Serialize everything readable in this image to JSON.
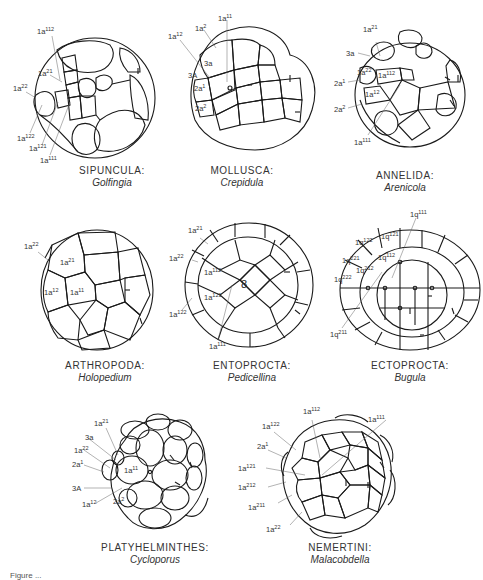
{
  "panels": [
    {
      "id": "sipuncula",
      "phylum": "Sipuncula:",
      "genus": "Golfingia",
      "labels": [
        {
          "base": "1a",
          "sup": "112"
        },
        {
          "base": "1a",
          "sup": "21"
        },
        {
          "base": "1a",
          "sup": "22"
        },
        {
          "base": "1a",
          "sup": "122"
        },
        {
          "base": "1a",
          "sup": "121"
        },
        {
          "base": "1a",
          "sup": "111"
        }
      ]
    },
    {
      "id": "mollusca",
      "phylum": "Mollusca:",
      "genus": "Crepidula",
      "labels": [
        {
          "base": "1a",
          "sup": "11"
        },
        {
          "base": "1a",
          "sup": "2"
        },
        {
          "base": "1a",
          "sup": "12"
        },
        {
          "base": "3a",
          "sup": ""
        },
        {
          "base": "3A",
          "sup": ""
        },
        {
          "base": "2a",
          "sup": "1"
        },
        {
          "base": "2a",
          "sup": "2"
        }
      ]
    },
    {
      "id": "annelida",
      "phylum": "Annelida:",
      "genus": "Arenicola",
      "labels": [
        {
          "base": "1a",
          "sup": "21"
        },
        {
          "base": "3a",
          "sup": ""
        },
        {
          "base": "1a",
          "sup": "22"
        },
        {
          "base": "1a",
          "sup": "112"
        },
        {
          "base": "2a",
          "sup": "1"
        },
        {
          "base": "1a",
          "sup": "12"
        },
        {
          "base": "2a",
          "sup": "2"
        },
        {
          "base": "1a",
          "sup": "111"
        }
      ]
    },
    {
      "id": "arthropoda",
      "phylum": "Arthropoda:",
      "genus": "Holopedium",
      "labels": [
        {
          "base": "1a",
          "sup": "22"
        },
        {
          "base": "1a",
          "sup": "21"
        },
        {
          "base": "1a",
          "sup": "12"
        },
        {
          "base": "1a",
          "sup": "11"
        }
      ]
    },
    {
      "id": "entoprocta",
      "phylum": "Entoprocta:",
      "genus": "Pedicellina",
      "labels": [
        {
          "base": "1a",
          "sup": "21"
        },
        {
          "base": "1a",
          "sup": "22"
        },
        {
          "base": "1a",
          "sup": "112"
        },
        {
          "base": "1a",
          "sup": "121"
        },
        {
          "base": "1a",
          "sup": "122"
        },
        {
          "base": "1a",
          "sup": "111"
        }
      ]
    },
    {
      "id": "ectoprocta",
      "phylum": "Ectoprocta:",
      "genus": "Bugula",
      "labels": [
        {
          "base": "1q",
          "sup": "111"
        },
        {
          "base": "1q",
          "sup": "121"
        },
        {
          "base": "1q",
          "sup": "122"
        },
        {
          "base": "1q",
          "sup": "112"
        },
        {
          "base": "1q",
          "sup": "221"
        },
        {
          "base": "1q",
          "sup": "212"
        },
        {
          "base": "1q",
          "sup": "222"
        },
        {
          "base": "1q",
          "sup": "211"
        }
      ]
    },
    {
      "id": "platyhelminthes",
      "phylum": "Platyhelminthes:",
      "genus": "Cycloporus",
      "labels": [
        {
          "base": "1a",
          "sup": "21"
        },
        {
          "base": "3a",
          "sup": ""
        },
        {
          "base": "1a",
          "sup": "22"
        },
        {
          "base": "2a",
          "sup": "1"
        },
        {
          "base": "1a",
          "sup": "11"
        },
        {
          "base": "3A",
          "sup": ""
        },
        {
          "base": "1a",
          "sup": "12"
        },
        {
          "base": "2a",
          "sup": "2"
        }
      ]
    },
    {
      "id": "nemertini",
      "phylum": "Nemertini:",
      "genus": "Malacobdella",
      "labels": [
        {
          "base": "1a",
          "sup": "112"
        },
        {
          "base": "1a",
          "sup": "111"
        },
        {
          "base": "1a",
          "sup": "122"
        },
        {
          "base": "2a",
          "sup": "1"
        },
        {
          "base": "1a",
          "sup": "121"
        },
        {
          "base": "1a",
          "sup": "212"
        },
        {
          "base": "1a",
          "sup": "211"
        },
        {
          "base": "1a",
          "sup": "22"
        }
      ]
    }
  ],
  "figure_caption": "Figure ..."
}
